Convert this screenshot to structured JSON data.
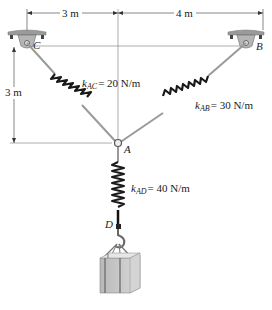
{
  "diagram": {
    "dimensions": {
      "horizontal_left": "3 m",
      "horizontal_right": "4 m",
      "vertical": "3 m"
    },
    "points": {
      "C": "C",
      "B": "B",
      "A": "A",
      "D": "D"
    },
    "springs": {
      "AC": {
        "k_symbol": "k",
        "subscript": "AC",
        "value": "= 20 N/m"
      },
      "AB": {
        "k_symbol": "k",
        "subscript": "AB",
        "value": "= 30 N/m"
      },
      "AD": {
        "k_symbol": "k",
        "subscript": "AD",
        "value": "= 40 N/m"
      }
    },
    "colors": {
      "rod": "#9a9a9a",
      "spring": "#1a1a1a",
      "support": "#a9a9a9",
      "crate": "#c8c8c8",
      "line": "#555555"
    }
  }
}
